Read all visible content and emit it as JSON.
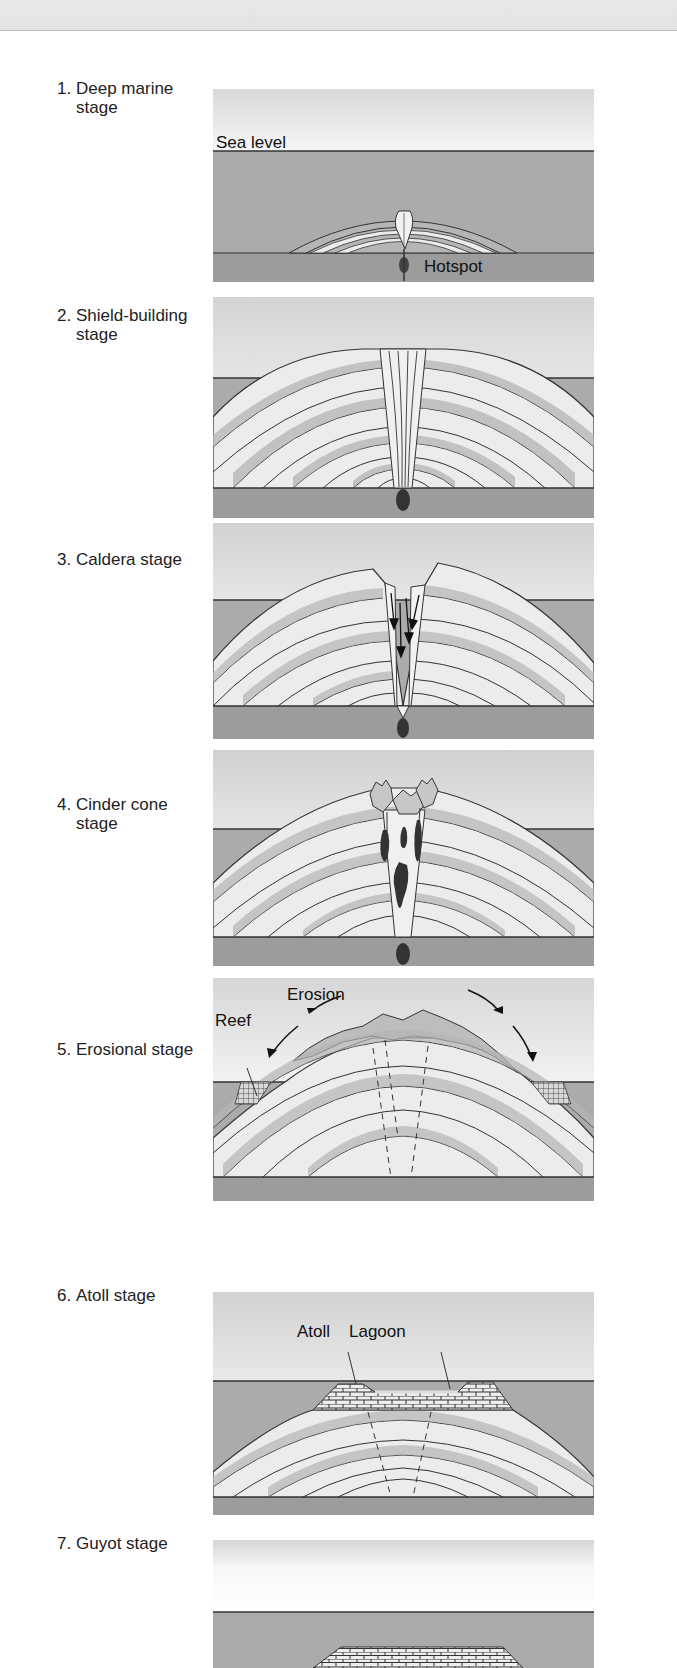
{
  "stages": [
    {
      "number": "1.",
      "line1": "Deep marine",
      "line2": "stage",
      "callouts": {
        "sea_level": "Sea level",
        "hotspot": "Hotspot"
      }
    },
    {
      "number": "2.",
      "line1": "Shield-building",
      "line2": "stage"
    },
    {
      "number": "3.",
      "line1": "Caldera stage",
      "line2": ""
    },
    {
      "number": "4.",
      "line1": "Cinder cone",
      "line2": "stage"
    },
    {
      "number": "5.",
      "line1": "Erosional stage",
      "line2": "",
      "callouts": {
        "erosion": "Erosion",
        "reef": "Reef"
      }
    },
    {
      "number": "6.",
      "line1": "Atoll stage",
      "line2": "",
      "callouts": {
        "atoll": "Atoll",
        "lagoon": "Lagoon"
      }
    },
    {
      "number": "7.",
      "line1": "Guyot stage",
      "line2": ""
    }
  ],
  "colors": {
    "sea": "#a9a9a9",
    "seafloor": "#9a9a9a",
    "sky": "#e4e4e4",
    "layer_light": "#ececec",
    "layer_dark": "#b4b4b4",
    "ink": "#2a2a2a",
    "magma": "#333333"
  }
}
